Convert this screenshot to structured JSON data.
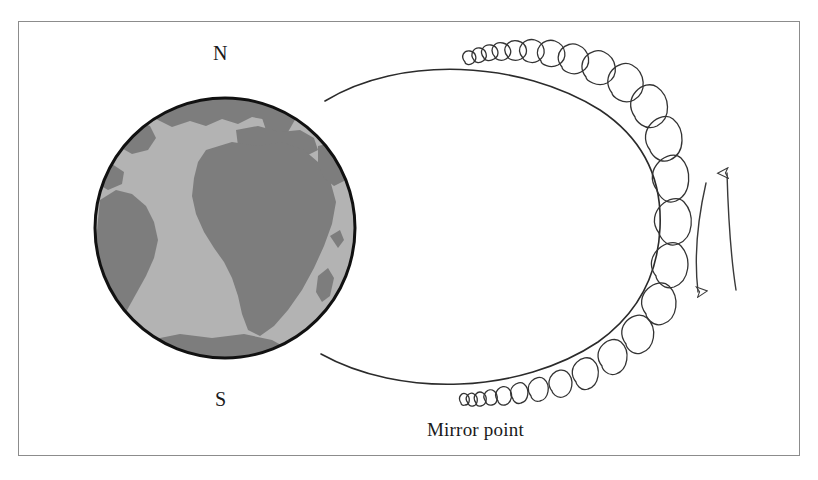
{
  "figure": {
    "border_color": "#8c8c8c",
    "background_color": "#ffffff"
  },
  "labels": {
    "north_pole": "N",
    "south_pole": "S",
    "mirror_point": "Mirror point"
  },
  "globe": {
    "center_x": 225,
    "center_y": 228,
    "radius": 132,
    "ocean_color": "#b3b3b3",
    "land_color": "#7d7d7d",
    "outline_color": "#111111",
    "outline_width": 3
  },
  "field_line": {
    "color": "#2b2b2b",
    "width": 1.6,
    "north_footpoint": [
      325,
      101
    ],
    "south_footpoint": [
      321,
      354
    ],
    "apex": [
      655,
      228
    ]
  },
  "helix": {
    "color": "#333333",
    "width": 1.3,
    "description": "tight coils at mirror points widening toward the field line apex"
  },
  "bounce_arrows": {
    "color": "#3a3a3a",
    "left_arrow_direction": "down",
    "right_arrow_direction": "up",
    "left_arrow": {
      "start": [
        705,
        182
      ],
      "end": [
        697,
        295
      ]
    },
    "right_arrow": {
      "start": [
        735,
        290
      ],
      "end": [
        726,
        170
      ]
    }
  }
}
